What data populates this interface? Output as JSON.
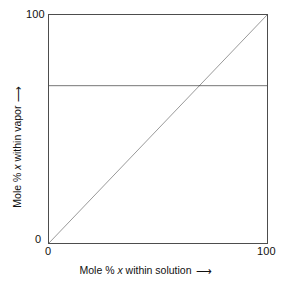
{
  "chart_data": {
    "type": "line",
    "title": "",
    "subtitle": "",
    "xlabel_prefix": "Mole % ",
    "xlabel_var": "x",
    "xlabel_suffix": " within solution",
    "ylabel_prefix": "Mole % ",
    "ylabel_var": "x",
    "ylabel_suffix": " within vapor",
    "xlim": [
      0,
      100
    ],
    "ylim": [
      0,
      100
    ],
    "xticks": [
      "0",
      "100"
    ],
    "yticks": [
      "0",
      "100"
    ],
    "xtick_values": [
      0,
      100
    ],
    "ytick_values": [
      0,
      100
    ],
    "grid": false,
    "legend": "none",
    "series": [
      {
        "name": "azeotrope-vapor-composition",
        "description": "horizontal line: vapor composition constant",
        "x": [
          0,
          100
        ],
        "values": [
          69,
          69
        ],
        "style": "solid",
        "color": "#1a1a1a"
      },
      {
        "name": "ideal-diagonal",
        "description": "diagonal reference line y = x",
        "x": [
          0,
          100
        ],
        "values": [
          0,
          100
        ],
        "style": "solid",
        "color": "#1a1a1a"
      }
    ],
    "annotations": {
      "intersection_x": 69,
      "intersection_y": 69
    },
    "axis_colors": {
      "frame": "#4d4d4d",
      "line": "#1a1a1a"
    }
  },
  "axes": {
    "x_arrow_glyph": "⟶",
    "y_arrow_glyph": "⟶"
  }
}
